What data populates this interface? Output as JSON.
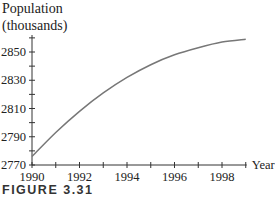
{
  "figure_label": "FIGURE 3.31",
  "chart_data": {
    "type": "line",
    "title": "",
    "ylabel": "Population (thousands)",
    "ylabel_lines": [
      "Population",
      "(thousands)"
    ],
    "xlabel": "Year",
    "xlim": [
      1990,
      1999
    ],
    "ylim": [
      2770,
      2862
    ],
    "x_ticks": [
      1990,
      1992,
      1994,
      1996,
      1998
    ],
    "y_ticks": [
      2770,
      2790,
      2810,
      2830,
      2850
    ],
    "x_tick_labels": [
      "1990",
      "1992",
      "1994",
      "1996",
      "1998"
    ],
    "y_tick_labels": [
      "2770",
      "2790",
      "2810",
      "2830",
      "2850"
    ],
    "grid": false,
    "legend": null,
    "series": [
      {
        "name": "Population",
        "x": [
          1990,
          1991,
          1992,
          1993,
          1994,
          1995,
          1996,
          1997,
          1998,
          1999
        ],
        "values": [
          2776,
          2793,
          2808,
          2821,
          2832,
          2841,
          2848,
          2853,
          2857,
          2859
        ]
      }
    ]
  }
}
